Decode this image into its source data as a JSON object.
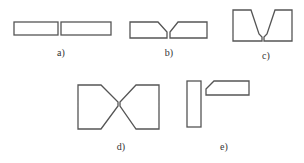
{
  "figures": [
    {
      "id": "a",
      "label": "a)",
      "label_pos": [
        61,
        47
      ]
    },
    {
      "id": "b",
      "label": "b)",
      "label_pos": [
        169,
        47
      ]
    },
    {
      "id": "c",
      "label": "c)",
      "label_pos": [
        266,
        49
      ]
    },
    {
      "id": "d",
      "label": "d)",
      "label_pos": [
        121,
        142
      ]
    },
    {
      "id": "e",
      "label": "e)",
      "label_pos": [
        224,
        142
      ]
    }
  ],
  "colors": {
    "stroke": "#555555",
    "background": "#ffffff"
  }
}
